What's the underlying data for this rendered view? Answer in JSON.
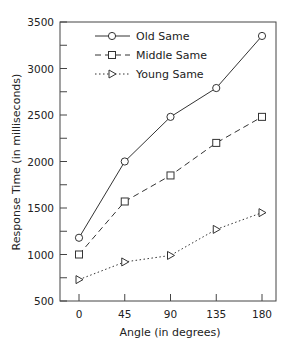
{
  "chart_data": {
    "type": "line",
    "title": "",
    "xlabel": "Angle (in degrees)",
    "ylabel": "Response Time (in milliseconds)",
    "x": [
      0,
      45,
      90,
      135,
      180
    ],
    "xticks": [
      "0",
      "45",
      "90",
      "135",
      "180"
    ],
    "yticks": [
      "500",
      "1000",
      "1500",
      "2000",
      "2500",
      "3000",
      "3500"
    ],
    "ylim": [
      500,
      3500
    ],
    "xlim": [
      -20,
      195
    ],
    "grid": false,
    "legend_position": "upper left",
    "series": [
      {
        "name": "Old Same",
        "marker": "circle",
        "line": "solid",
        "values": [
          1180,
          2000,
          2480,
          2790,
          3350
        ]
      },
      {
        "name": "Middle Same",
        "marker": "square",
        "line": "dashed",
        "values": [
          1000,
          1570,
          1850,
          2200,
          2480
        ]
      },
      {
        "name": "Young Same",
        "marker": "triangle-right",
        "line": "dotted",
        "values": [
          730,
          920,
          990,
          1270,
          1450
        ]
      }
    ]
  },
  "colors": {
    "line": "#333333",
    "frame": "#444444"
  }
}
